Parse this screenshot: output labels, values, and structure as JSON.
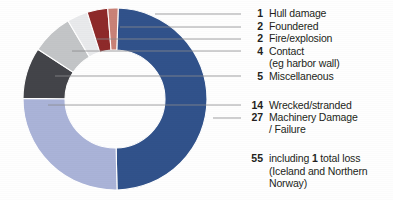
{
  "chart_data": {
    "type": "pie",
    "title": "",
    "subtitle": "",
    "xlabel": "",
    "ylabel": "",
    "legend_position": "right",
    "grid": false,
    "donut": true,
    "total": 55,
    "total_label": "55",
    "total_text_prefix": "including ",
    "total_text_bold": "1",
    "total_text_suffix": " total loss (Iceland and Northern Norway)",
    "categories": [
      "Machinery Damage / Failure",
      "Wrecked/stranded",
      "Miscellaneous",
      "Contact (eg harbor wall)",
      "Fire/explosion",
      "Foundered",
      "Hull damage"
    ],
    "values": [
      27,
      14,
      5,
      4,
      2,
      2,
      1
    ],
    "colors": [
      "#31528b",
      "#aab3d8",
      "#434449",
      "#c3c5c7",
      "#e9eaec",
      "#8e2a2a",
      "#c98277"
    ],
    "slices": [
      {
        "value": 27,
        "label": "Machinery Damage / Failure",
        "color": "#31528b"
      },
      {
        "value": 14,
        "label": "Wrecked/stranded",
        "color": "#aab3d8"
      },
      {
        "value": 5,
        "label": "Miscellaneous",
        "color": "#434449"
      },
      {
        "value": 4,
        "label": "Contact (eg harbor wall)",
        "color": "#c3c5c7"
      },
      {
        "value": 2,
        "label": "Fire/explosion",
        "color": "#e9eaec"
      },
      {
        "value": 2,
        "label": "Foundered",
        "color": "#8e2a2a"
      },
      {
        "value": 1,
        "label": "Hull damage",
        "color": "#c98277"
      }
    ]
  },
  "legend": {
    "items": [
      {
        "count": "1",
        "label": "Hull damage",
        "sub": ""
      },
      {
        "count": "2",
        "label": "Foundered",
        "sub": ""
      },
      {
        "count": "2",
        "label": "Fire/explosion",
        "sub": ""
      },
      {
        "count": "4",
        "label": "Contact",
        "sub": "(eg harbor wall)"
      },
      {
        "count": "5",
        "label": "Miscellaneous",
        "sub": ""
      },
      {
        "count": "14",
        "label": "Wrecked/stranded",
        "sub": ""
      },
      {
        "count": "27",
        "label": "Machinery Damage",
        "sub": "/ Failure"
      }
    ],
    "total": {
      "count": "55",
      "line1_a": "including ",
      "line1_b": "1",
      "line1_c": " total",
      "line2": "loss (Iceland and",
      "line3": "Northern Norway)"
    }
  },
  "colors": {
    "navy": "#31528b",
    "periwinkle": "#aab3d8",
    "charcoal": "#434449",
    "gray": "#c3c5c7",
    "offwhite": "#e9eaec",
    "maroon": "#8e2a2a",
    "salmon": "#c98277",
    "text": "#231f20",
    "leader": "#8a8c8e",
    "background": "#fefefe"
  }
}
